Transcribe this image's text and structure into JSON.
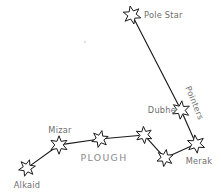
{
  "diagram": {
    "title": "PLOUGH",
    "group_label": "PLOUGH",
    "pointers_label": "Pointers",
    "background_color": "#ffffff",
    "line_color": "#1a1a1a",
    "star_fill_color": "#ffffff",
    "star_stroke_color": "#1a1a1a",
    "label_color": "#6e6e6e",
    "group_label_color": "#8a8a8a",
    "width": 221,
    "height": 195
  },
  "chart_data": {
    "type": "scatter",
    "title": "PLOUGH",
    "xlabel": "",
    "ylabel": "",
    "xlim": [
      0,
      221
    ],
    "ylim": [
      0,
      195
    ],
    "grid": false,
    "legend": "none",
    "annotations": [
      "PLOUGH",
      "Pointers"
    ],
    "stars": [
      {
        "name": "pole-star",
        "label": "Pole Star",
        "x": 132,
        "y": 15,
        "radius": 9.2,
        "label_x": 144,
        "label_y": 15,
        "label_anchor": "start",
        "labeled": true
      },
      {
        "name": "dubhe",
        "label": "Dubhe",
        "x": 181,
        "y": 110,
        "radius": 9.2,
        "label_x": 176,
        "label_y": 110,
        "label_anchor": "end",
        "labeled": true
      },
      {
        "name": "merak",
        "label": "Merak",
        "x": 196,
        "y": 144,
        "radius": 9.2,
        "label_x": 199,
        "label_y": 161,
        "label_anchor": "middle",
        "labeled": true
      },
      {
        "name": "phecda",
        "label": "",
        "x": 165,
        "y": 158,
        "radius": 8.6,
        "label_x": 0,
        "label_y": 0,
        "label_anchor": "middle",
        "labeled": false
      },
      {
        "name": "megrez",
        "label": "",
        "x": 144,
        "y": 135,
        "radius": 8.6,
        "label_x": 0,
        "label_y": 0,
        "label_anchor": "middle",
        "labeled": false
      },
      {
        "name": "alioth",
        "label": "",
        "x": 100,
        "y": 139,
        "radius": 8.6,
        "label_x": 0,
        "label_y": 0,
        "label_anchor": "middle",
        "labeled": false
      },
      {
        "name": "mizar",
        "label": "Mizar",
        "x": 59,
        "y": 145,
        "radius": 9.2,
        "label_x": 60,
        "label_y": 130,
        "label_anchor": "middle",
        "labeled": true
      },
      {
        "name": "alkaid",
        "label": "Alkaid",
        "x": 27,
        "y": 168,
        "radius": 8.6,
        "label_x": 27,
        "label_y": 185,
        "label_anchor": "middle",
        "labeled": true
      }
    ],
    "links": [
      {
        "from": "pole-star",
        "to": "dubhe"
      },
      {
        "from": "dubhe",
        "to": "merak"
      },
      {
        "from": "merak",
        "to": "phecda"
      },
      {
        "from": "phecda",
        "to": "megrez"
      },
      {
        "from": "megrez",
        "to": "alioth"
      },
      {
        "from": "alioth",
        "to": "mizar"
      },
      {
        "from": "mizar",
        "to": "alkaid"
      }
    ],
    "group_label_position": {
      "x": 104,
      "y": 161
    },
    "pointers_label_position": {
      "x": 192,
      "y": 104,
      "rotation": 68
    }
  }
}
